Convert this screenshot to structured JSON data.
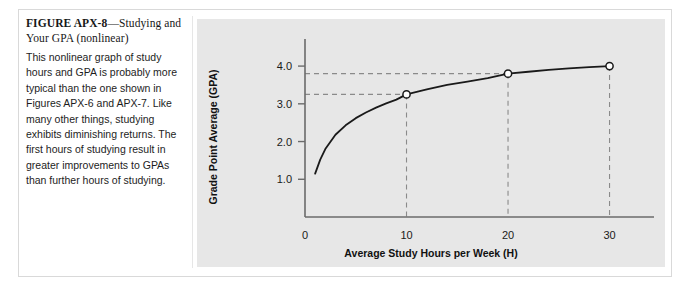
{
  "figure": {
    "title_number": "FIGURE APX-8",
    "title_rest": "—Studying and Your GPA (nonlinear)",
    "body_text": "This nonlinear graph of study hours and GPA is probably more typical than the one shown in Figures APX-6 and APX-7. Like many other things, studying exhibits diminishing returns. The first hours of studying result in greater improvements to GPAs than further hours of studying."
  },
  "colors": {
    "panel_background": "#e7e7e7",
    "page_background": "#ffffff",
    "curve": "#1a1a1a",
    "axis": "#6b6b6b",
    "guide_dashed": "#8a8a8a",
    "marker_fill": "#ffffff",
    "frame_border": "#d9d9d9"
  },
  "chart_data": {
    "type": "line",
    "title": "",
    "subtitle": "",
    "xlabel": "Average Study Hours per Week (H)",
    "ylabel": "Grade Point Average (GPA)",
    "xlim": [
      0,
      33
    ],
    "ylim": [
      0,
      4.4
    ],
    "xticks": [
      0,
      10,
      20,
      30
    ],
    "xtick_labels": [
      "0",
      "10",
      "20",
      "30"
    ],
    "yticks": [
      1.0,
      2.0,
      3.0,
      4.0
    ],
    "ytick_labels": [
      "1.0",
      "2.0",
      "3.0",
      "4.0"
    ],
    "grid": false,
    "legend": "none",
    "series": [
      {
        "name": "GPA vs study hours (diminishing returns)",
        "x": [
          1.0,
          1.5,
          2,
          3,
          4,
          5,
          6,
          7,
          8,
          9,
          10,
          12,
          14,
          16,
          18,
          20,
          22,
          24,
          26,
          28,
          30
        ],
        "y": [
          1.15,
          1.52,
          1.8,
          2.18,
          2.43,
          2.62,
          2.77,
          2.9,
          3.01,
          3.11,
          3.25,
          3.38,
          3.5,
          3.59,
          3.68,
          3.8,
          3.85,
          3.9,
          3.94,
          3.97,
          4.0
        ]
      }
    ],
    "markers": [
      {
        "label": "10 hours",
        "x": 10,
        "y": 3.25,
        "style": "open-circle"
      },
      {
        "label": "20 hours",
        "x": 20,
        "y": 3.8,
        "style": "open-circle"
      },
      {
        "label": "30 hours",
        "x": 30,
        "y": 4.0,
        "style": "open-circle"
      }
    ],
    "guide_lines": [
      {
        "orientation": "horizontal",
        "value": 3.25,
        "from_x": 0,
        "to_x": 10,
        "style": "dashed"
      },
      {
        "orientation": "horizontal",
        "value": 3.8,
        "from_x": 0,
        "to_x": 20,
        "style": "dashed"
      },
      {
        "orientation": "vertical",
        "value": 10,
        "from_y": 0,
        "to_y": 3.25,
        "style": "dashed"
      },
      {
        "orientation": "vertical",
        "value": 20,
        "from_y": 0,
        "to_y": 3.8,
        "style": "dashed"
      },
      {
        "orientation": "vertical",
        "value": 30,
        "from_y": 0,
        "to_y": 4.0,
        "style": "dashed"
      }
    ],
    "annotation": "Curve rises steeply for the first hours of study and flattens toward a GPA of 4.0, illustrating diminishing returns."
  }
}
